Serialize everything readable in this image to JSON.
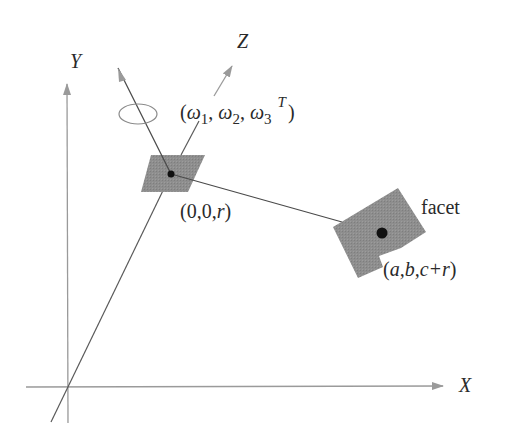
{
  "diagram": {
    "axes": {
      "x_label": "X",
      "y_label": "Y",
      "z_label": "Z"
    },
    "rotation": {
      "open": "(",
      "omega": "ω",
      "sub1": "1",
      "sub2": "2",
      "sub3": "3",
      "sep": ", ",
      "sup": "T",
      "close": ")"
    },
    "small_patch_label": {
      "prefix": "(0,0,",
      "var": "r",
      "suffix": ")"
    },
    "facet": {
      "label": "facet",
      "coord_open": "(",
      "coord_body": "a,b,c+r",
      "coord_close": ")"
    },
    "colors": {
      "axis_gray": "#9a9a9a",
      "line_dark": "#4a4a4a",
      "patch_fill": "#8c8c8c",
      "dot": "#111111"
    }
  }
}
